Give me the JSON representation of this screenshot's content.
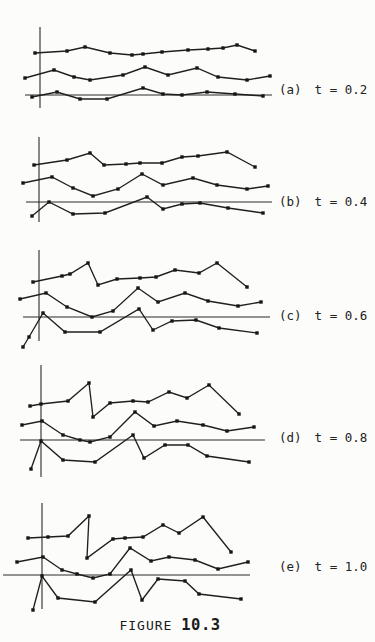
{
  "figure": {
    "caption": {
      "prefix": "FIGURE",
      "number": "10.3"
    },
    "panels": [
      {
        "tag": "(a)",
        "t_label": "t = 0.2"
      },
      {
        "tag": "(b)",
        "t_label": "t = 0.4"
      },
      {
        "tag": "(c)",
        "t_label": "t = 0.6"
      },
      {
        "tag": "(d)",
        "t_label": "t = 0.8"
      },
      {
        "tag": "(e)",
        "t_label": "t = 1.0"
      }
    ]
  },
  "chart_data": {
    "type": "line",
    "title": "FIGURE 10.3",
    "subtitle": "Five panels of three jagged sample paths each, shown at increasing time values t; amplitude of fluctuation grows with t",
    "legend": "none",
    "grid": false,
    "axes_labeled": false,
    "coordinate_note": "points are in screenshot pixel coordinates (y grows downward); each panel has a vertical axis segment and a horizontal zero line",
    "panels": [
      {
        "label": "(a)",
        "t_label": "t = 0.2",
        "t": 0.2,
        "axis": {
          "x": 40,
          "y1": 27,
          "y2": 108
        },
        "zero_line": {
          "y": 95,
          "x1": 25,
          "x2": 272
        },
        "series": [
          {
            "name": "sample-path-1",
            "points": [
              [
                35,
                53
              ],
              [
                67,
                51
              ],
              [
                85,
                47
              ],
              [
                110,
                53
              ],
              [
                132,
                55
              ],
              [
                143,
                54
              ],
              [
                162,
                52
              ],
              [
                188,
                50
              ],
              [
                208,
                49
              ],
              [
                223,
                48
              ],
              [
                237,
                45
              ],
              [
                255,
                51
              ]
            ]
          },
          {
            "name": "sample-path-2",
            "points": [
              [
                25,
                78
              ],
              [
                54,
                70
              ],
              [
                74,
                77
              ],
              [
                90,
                80
              ],
              [
                123,
                75
              ],
              [
                145,
                67
              ],
              [
                168,
                75
              ],
              [
                197,
                68
              ],
              [
                218,
                77
              ],
              [
                247,
                80
              ],
              [
                270,
                76
              ]
            ]
          },
          {
            "name": "sample-path-3",
            "points": [
              [
                32,
                97
              ],
              [
                57,
                92
              ],
              [
                80,
                99
              ],
              [
                107,
                99
              ],
              [
                143,
                88
              ],
              [
                163,
                94
              ],
              [
                182,
                95
              ],
              [
                207,
                92
              ],
              [
                235,
                94
              ],
              [
                263,
                96
              ]
            ]
          }
        ]
      },
      {
        "label": "(b)",
        "t_label": "t = 0.4",
        "t": 0.4,
        "axis": {
          "x": 39,
          "y1": 137,
          "y2": 222
        },
        "zero_line": {
          "y": 202,
          "x1": 26,
          "x2": 272
        },
        "series": [
          {
            "name": "sample-path-1",
            "points": [
              [
                34,
                165
              ],
              [
                67,
                160
              ],
              [
                90,
                153
              ],
              [
                104,
                165
              ],
              [
                126,
                164
              ],
              [
                140,
                163
              ],
              [
                162,
                163
              ],
              [
                182,
                157
              ],
              [
                198,
                156
              ],
              [
                227,
                152
              ],
              [
                255,
                167
              ]
            ]
          },
          {
            "name": "sample-path-2",
            "points": [
              [
                23,
                183
              ],
              [
                52,
                177
              ],
              [
                73,
                188
              ],
              [
                93,
                196
              ],
              [
                118,
                189
              ],
              [
                142,
                174
              ],
              [
                163,
                185
              ],
              [
                193,
                178
              ],
              [
                217,
                185
              ],
              [
                247,
                189
              ],
              [
                268,
                186
              ]
            ]
          },
          {
            "name": "sample-path-3",
            "points": [
              [
                32,
                216
              ],
              [
                49,
                202
              ],
              [
                73,
                214
              ],
              [
                105,
                213
              ],
              [
                147,
                197
              ],
              [
                163,
                209
              ],
              [
                182,
                204
              ],
              [
                200,
                203
              ],
              [
                228,
                208
              ],
              [
                263,
                213
              ]
            ]
          }
        ]
      },
      {
        "label": "(c)",
        "t_label": "t = 0.6",
        "t": 0.6,
        "axis": {
          "x": 39,
          "y1": 250,
          "y2": 341
        },
        "zero_line": {
          "y": 317,
          "x1": 23,
          "x2": 270
        },
        "series": [
          {
            "name": "sample-path-1",
            "points": [
              [
                33,
                282
              ],
              [
                62,
                276
              ],
              [
                70,
                274
              ],
              [
                88,
                263
              ],
              [
                98,
                285
              ],
              [
                117,
                279
              ],
              [
                140,
                278
              ],
              [
                156,
                277
              ],
              [
                175,
                270
              ],
              [
                199,
                273
              ],
              [
                217,
                263
              ],
              [
                247,
                287
              ]
            ]
          },
          {
            "name": "sample-path-2",
            "points": [
              [
                20,
                299
              ],
              [
                46,
                293
              ],
              [
                67,
                307
              ],
              [
                92,
                317
              ],
              [
                113,
                311
              ],
              [
                138,
                288
              ],
              [
                158,
                302
              ],
              [
                185,
                293
              ],
              [
                208,
                301
              ],
              [
                238,
                306
              ],
              [
                261,
                302
              ]
            ]
          },
          {
            "name": "sample-path-3",
            "points": [
              [
                23,
                347
              ],
              [
                29,
                337
              ],
              [
                43,
                313
              ],
              [
                65,
                332
              ],
              [
                100,
                332
              ],
              [
                139,
                309
              ],
              [
                153,
                330
              ],
              [
                172,
                321
              ],
              [
                196,
                320
              ],
              [
                219,
                328
              ],
              [
                257,
                333
              ]
            ]
          }
        ]
      },
      {
        "label": "(d)",
        "t_label": "t = 0.8",
        "t": 0.8,
        "axis": {
          "x": 41,
          "y1": 365,
          "y2": 477
        },
        "zero_line": {
          "y": 440,
          "x1": 20,
          "x2": 265
        },
        "series": [
          {
            "name": "sample-path-1",
            "points": [
              [
                30,
                406
              ],
              [
                41,
                404
              ],
              [
                68,
                401
              ],
              [
                89,
                383
              ],
              [
                93,
                417
              ],
              [
                110,
                403
              ],
              [
                133,
                401
              ],
              [
                148,
                402
              ],
              [
                169,
                392
              ],
              [
                187,
                398
              ],
              [
                209,
                385
              ],
              [
                239,
                414
              ]
            ]
          },
          {
            "name": "sample-path-2",
            "points": [
              [
                22,
                425
              ],
              [
                42,
                421
              ],
              [
                63,
                435
              ],
              [
                80,
                440
              ],
              [
                90,
                442
              ],
              [
                110,
                437
              ],
              [
                135,
                412
              ],
              [
                154,
                426
              ],
              [
                177,
                421
              ],
              [
                203,
                425
              ],
              [
                227,
                431
              ],
              [
                254,
                427
              ]
            ]
          },
          {
            "name": "sample-path-3",
            "points": [
              [
                31,
                469
              ],
              [
                41,
                441
              ],
              [
                63,
                460
              ],
              [
                95,
                462
              ],
              [
                133,
                435
              ],
              [
                144,
                458
              ],
              [
                165,
                445
              ],
              [
                188,
                445
              ],
              [
                207,
                456
              ],
              [
                249,
                462
              ]
            ]
          }
        ]
      },
      {
        "label": "(e)",
        "t_label": "t = 1.0",
        "t": 1.0,
        "axis": {
          "x": 42,
          "y1": 503,
          "y2": 609
        },
        "zero_line": {
          "y": 575,
          "x1": 3,
          "x2": 250
        },
        "series": [
          {
            "name": "sample-path-1",
            "points": [
              [
                28,
                538
              ],
              [
                48,
                537
              ],
              [
                68,
                536
              ],
              [
                89,
                516
              ],
              [
                87,
                558
              ],
              [
                113,
                539
              ],
              [
                125,
                538
              ],
              [
                143,
                537
              ],
              [
                163,
                525
              ],
              [
                179,
                533
              ],
              [
                203,
                517
              ],
              [
                231,
                552
              ]
            ]
          },
          {
            "name": "sample-path-2",
            "points": [
              [
                17,
                562
              ],
              [
                43,
                557
              ],
              [
                62,
                570
              ],
              [
                77,
                574
              ],
              [
                93,
                578
              ],
              [
                110,
                574
              ],
              [
                130,
                548
              ],
              [
                151,
                561
              ],
              [
                169,
                557
              ],
              [
                195,
                560
              ],
              [
                218,
                569
              ],
              [
                248,
                562
              ]
            ]
          },
          {
            "name": "sample-path-3",
            "points": [
              [
                33,
                610
              ],
              [
                42,
                576
              ],
              [
                58,
                598
              ],
              [
                95,
                602
              ],
              [
                131,
                570
              ],
              [
                142,
                600
              ],
              [
                158,
                579
              ],
              [
                185,
                581
              ],
              [
                199,
                594
              ],
              [
                241,
                599
              ]
            ]
          }
        ]
      }
    ]
  }
}
